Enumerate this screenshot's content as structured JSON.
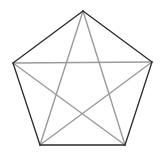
{
  "diagram": {
    "type": "pentagon-with-star",
    "vertices": [
      {
        "id": "A",
        "x": 83,
        "y": 11
      },
      {
        "id": "B",
        "x": 152,
        "y": 62
      },
      {
        "id": "C",
        "x": 125,
        "y": 145
      },
      {
        "id": "D",
        "x": 40,
        "y": 145
      },
      {
        "id": "E",
        "x": 13,
        "y": 63
      }
    ],
    "pentagon_edges": [
      [
        "A",
        "B"
      ],
      [
        "B",
        "C"
      ],
      [
        "C",
        "D"
      ],
      [
        "D",
        "E"
      ],
      [
        "E",
        "A"
      ]
    ],
    "star_diagonals": [
      [
        "A",
        "C"
      ],
      [
        "A",
        "D"
      ],
      [
        "B",
        "D"
      ],
      [
        "B",
        "E"
      ],
      [
        "C",
        "E"
      ]
    ],
    "colors": {
      "background": "#ffffff",
      "pentagon_stroke": "#2a2a2a",
      "diagonal_stroke": "#9a9a9a"
    }
  }
}
